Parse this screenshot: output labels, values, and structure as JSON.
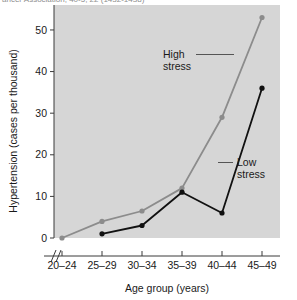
{
  "caption": {
    "text": "ancer Association; 40-5, 22 (1432-1438)"
  },
  "chart_data": {
    "type": "line",
    "title": "",
    "xlabel": "Age group (years)",
    "ylabel": "Hypertension (cases per thousand)",
    "categories": [
      "20–24",
      "25–29",
      "30–34",
      "35–39",
      "40–44",
      "45–49"
    ],
    "yticks": [
      0,
      10,
      20,
      30,
      40,
      50
    ],
    "ylim": [
      0,
      56
    ],
    "grid": false,
    "legend_position": "inline-annotations",
    "axis_break": "//",
    "series": [
      {
        "name": "High stress",
        "color": "#8c8c8c",
        "values": [
          0,
          4,
          6.5,
          12,
          29,
          53
        ]
      },
      {
        "name": "Low stress",
        "color": "#111111",
        "values": [
          null,
          1,
          3,
          11,
          6,
          36
        ]
      }
    ],
    "annotations": [
      {
        "label": "High stress",
        "target_series": "High stress",
        "target_category": "45–49"
      },
      {
        "label": "Low stress",
        "target_series": "Low stress",
        "target_category": "45–49"
      }
    ]
  },
  "colors": {
    "plot_background": "#d6d6d6",
    "page_background": "#ffffff",
    "axis": "#3a3a3a",
    "high_stress": "#8c8c8c",
    "low_stress": "#111111",
    "text": "#1a1a1a"
  }
}
